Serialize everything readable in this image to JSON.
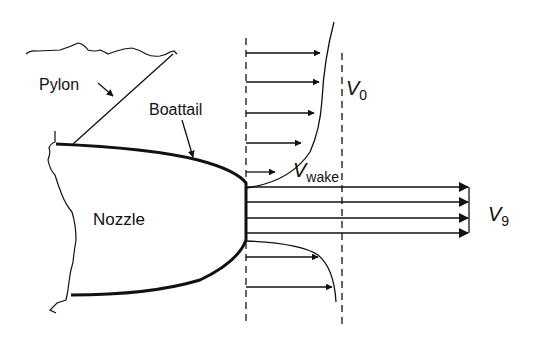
{
  "diagram": {
    "type": "nozzle-boattail-flow-schematic",
    "labels": {
      "pylon": "Pylon",
      "boattail": "Boattail",
      "nozzle": "Nozzle"
    },
    "symbols": {
      "v0": {
        "main": "V",
        "sub": "0"
      },
      "vwake": {
        "main": "V",
        "sub": "wake"
      },
      "v9": {
        "main": "V",
        "sub": "9"
      }
    },
    "colors": {
      "line": "#111111",
      "background": "#ffffff"
    },
    "velocity_profiles": {
      "upper_wake_arrows": 5,
      "jet_arrows": 4,
      "lower_wake_arrows": 2
    }
  }
}
